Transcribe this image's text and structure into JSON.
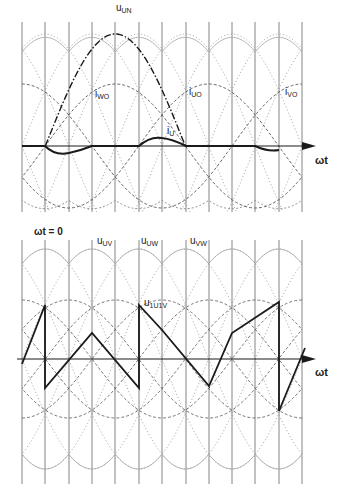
{
  "figure": {
    "type": "diagram",
    "colors": {
      "ink": "#1a1a1a",
      "grid": "#777777",
      "dotted": "#999999",
      "background": "#ffffff"
    }
  },
  "upper_panel": {
    "axis_label": "ωt",
    "labels": {
      "u_un": {
        "main": "u",
        "sub": "UN"
      },
      "i_wo": {
        "main": "i",
        "sub": "WO"
      },
      "i_uo": {
        "main": "i",
        "sub": "UO"
      },
      "i_vo": {
        "main": "i",
        "sub": "VO"
      },
      "i_u": {
        "main": "i",
        "sub": "U"
      }
    }
  },
  "lower_panel": {
    "start_label": "ωt = 0",
    "axis_label": "ωt",
    "labels": {
      "u_uv": {
        "main": "u",
        "sub": "UV"
      },
      "u_uw": {
        "main": "u",
        "sub": "UW"
      },
      "u_vw": {
        "main": "u",
        "sub": "VW"
      },
      "u_1u1v": {
        "main": "u",
        "sub": "1U1V"
      }
    }
  },
  "grid": {
    "vertical_lines_x": [
      22,
      45,
      69,
      92,
      115,
      139,
      162,
      186,
      209,
      232,
      255,
      279,
      302
    ],
    "step_deg": 30
  }
}
